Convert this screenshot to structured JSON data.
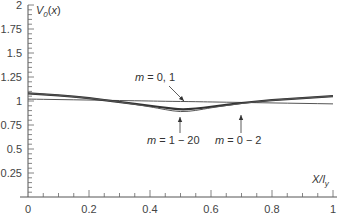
{
  "chart_data": {
    "type": "line",
    "title": "",
    "xlabel": "X/l_y",
    "ylabel": "V_0(x)",
    "xlim": [
      0,
      1
    ],
    "ylim": [
      0,
      2
    ],
    "grid": false,
    "x_ticks": [
      "0",
      "0.2",
      "0.4",
      "0.6",
      "0.8",
      "1"
    ],
    "y_ticks": [
      "0.25",
      "0.5",
      "0.75",
      "1",
      "1.25",
      "1.5",
      "1.75",
      "2"
    ],
    "x": [
      0,
      0.1,
      0.2,
      0.3,
      0.4,
      0.45,
      0.5,
      0.55,
      0.6,
      0.7,
      0.8,
      0.9,
      1.0
    ],
    "series": [
      {
        "name": "m = 0, 1",
        "style": "thin",
        "values": [
          1.02,
          1.015,
          1.01,
          1.005,
          1.0,
          0.997,
          0.995,
          0.993,
          0.99,
          0.985,
          0.98,
          0.975,
          0.97
        ]
      },
      {
        "name": "m = 0 - 2",
        "style": "thick",
        "values": [
          1.08,
          1.06,
          1.03,
          0.99,
          0.95,
          0.93,
          0.91,
          0.92,
          0.94,
          0.98,
          1.01,
          1.03,
          1.05
        ]
      },
      {
        "name": "m = 1 - 20",
        "style": "thin",
        "values": [
          1.08,
          1.06,
          1.03,
          0.99,
          0.94,
          0.91,
          0.885,
          0.9,
          0.93,
          0.975,
          1.01,
          1.03,
          1.05
        ]
      }
    ],
    "annotations": [
      {
        "label_prefix": "m",
        "label": " = 0, 1",
        "x": 0.36,
        "y": 1.19
      },
      {
        "label_prefix": "m",
        "label": " = 1 − 20",
        "x": 0.45,
        "y": 0.64
      },
      {
        "label_prefix": "m",
        "label": " = 0 − 2",
        "x": 0.62,
        "y": 0.64
      }
    ]
  }
}
